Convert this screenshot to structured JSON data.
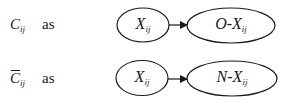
{
  "rows": [
    {
      "symbol": "C",
      "symbol_sub": "ij",
      "overbar": false,
      "as_label": "as",
      "source_node": {
        "main": "X",
        "sub": "ij"
      },
      "target_node": {
        "main": "O-X",
        "sub": "ij"
      }
    },
    {
      "symbol": "C",
      "symbol_sub": "ij",
      "overbar": true,
      "as_label": "as",
      "source_node": {
        "main": "X",
        "sub": "ij"
      },
      "target_node": {
        "main": "N-X",
        "sub": "ij"
      }
    }
  ],
  "colors": {
    "stroke": "#1a1a1a",
    "background": "#ffffff"
  }
}
